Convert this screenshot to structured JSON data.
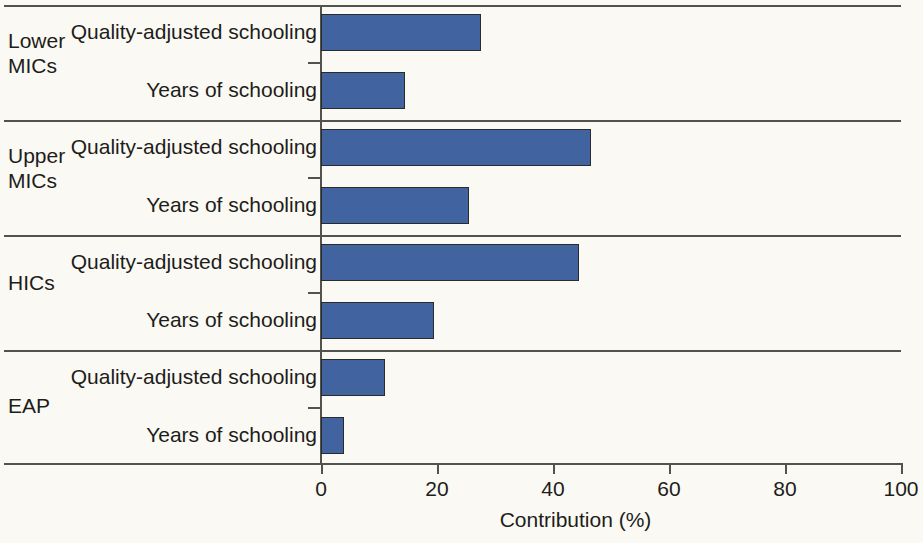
{
  "chart_data": {
    "type": "bar",
    "orientation": "horizontal",
    "title": "",
    "xlabel": "Contribution (%)",
    "ylabel": "",
    "xlim": [
      0,
      100
    ],
    "xticks": [
      0,
      20,
      40,
      60,
      80,
      100
    ],
    "xtick_labels": [
      "0",
      "20",
      "40",
      "60",
      "80",
      "100"
    ],
    "grid": false,
    "legend": false,
    "bar_color": "#41639f",
    "bar_edge_color": "#2b2b2b",
    "groups": [
      {
        "label": "Lower MICs",
        "label_line1": "Lower",
        "label_line2": "MICs",
        "bars": [
          {
            "label": "Quality-adjusted schooling",
            "value": 27.5
          },
          {
            "label": "Years of schooling",
            "value": 14.5
          }
        ]
      },
      {
        "label": "Upper MICs",
        "label_line1": "Upper",
        "label_line2": "MICs",
        "bars": [
          {
            "label": "Quality-adjusted schooling",
            "value": 46.5
          },
          {
            "label": "Years of schooling",
            "value": 25.5
          }
        ]
      },
      {
        "label": "HICs",
        "label_line1": "HICs",
        "label_line2": "",
        "bars": [
          {
            "label": "Quality-adjusted schooling",
            "value": 44.5
          },
          {
            "label": "Years of schooling",
            "value": 19.5
          }
        ]
      },
      {
        "label": "EAP",
        "label_line1": "EAP",
        "label_line2": "",
        "bars": [
          {
            "label": "Quality-adjusted schooling",
            "value": 11.0
          },
          {
            "label": "Years of schooling",
            "value": 4.0
          }
        ]
      }
    ]
  }
}
